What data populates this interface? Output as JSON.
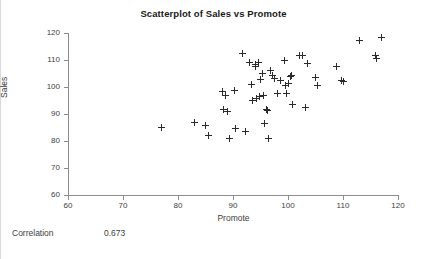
{
  "figure": {
    "title": "Scatterplot of Sales vs Promote",
    "correlation_label": "Correlation",
    "correlation_value": "0.673"
  },
  "chart_data": {
    "type": "scatter",
    "title": "Scatterplot of Sales vs Promote",
    "xlabel": "Promote",
    "ylabel": "Sales",
    "xlim": [
      60,
      120
    ],
    "ylim": [
      60,
      120
    ],
    "xticks": [
      60,
      70,
      80,
      90,
      100,
      110,
      120
    ],
    "yticks": [
      60,
      70,
      80,
      90,
      100,
      110,
      120
    ],
    "grid": false,
    "legend": false,
    "marker": "plus",
    "marker_color": "#2b2b2b",
    "correlation": 0.673,
    "series": [
      {
        "name": "Sales vs Promote",
        "points": [
          [
            77.0,
            84.9
          ],
          [
            83.0,
            86.7
          ],
          [
            85.0,
            85.8
          ],
          [
            85.5,
            82.0
          ],
          [
            88.0,
            98.4
          ],
          [
            88.3,
            91.8
          ],
          [
            88.6,
            97.0
          ],
          [
            89.0,
            90.9
          ],
          [
            89.4,
            80.9
          ],
          [
            90.2,
            98.6
          ],
          [
            90.4,
            84.8
          ],
          [
            91.8,
            112.5
          ],
          [
            92.2,
            83.7
          ],
          [
            93.0,
            109.0
          ],
          [
            93.3,
            100.8
          ],
          [
            93.6,
            94.9
          ],
          [
            94.0,
            107.6
          ],
          [
            94.1,
            108.3
          ],
          [
            94.3,
            95.9
          ],
          [
            94.6,
            109.2
          ],
          [
            94.8,
            96.3
          ],
          [
            95.0,
            102.9
          ],
          [
            95.3,
            104.9
          ],
          [
            95.6,
            96.7
          ],
          [
            95.8,
            86.6
          ],
          [
            96.0,
            91.6
          ],
          [
            96.2,
            91.4
          ],
          [
            96.4,
            80.8
          ],
          [
            96.8,
            106.0
          ],
          [
            97.2,
            104.1
          ],
          [
            97.6,
            103.3
          ],
          [
            98.0,
            97.7
          ],
          [
            98.6,
            102.3
          ],
          [
            99.3,
            109.8
          ],
          [
            99.6,
            100.6
          ],
          [
            99.8,
            97.5
          ],
          [
            100.1,
            101.4
          ],
          [
            100.4,
            103.9
          ],
          [
            100.6,
            104.1
          ],
          [
            100.9,
            93.6
          ],
          [
            102.0,
            111.6
          ],
          [
            102.6,
            111.5
          ],
          [
            103.2,
            92.5
          ],
          [
            103.6,
            108.6
          ],
          [
            105.0,
            103.4
          ],
          [
            105.3,
            100.6
          ],
          [
            108.8,
            107.5
          ],
          [
            109.8,
            102.3
          ],
          [
            110.0,
            101.9
          ],
          [
            113.0,
            117.3
          ],
          [
            115.9,
            111.7
          ],
          [
            116.0,
            110.6
          ],
          [
            117.0,
            118.3
          ]
        ]
      }
    ]
  }
}
